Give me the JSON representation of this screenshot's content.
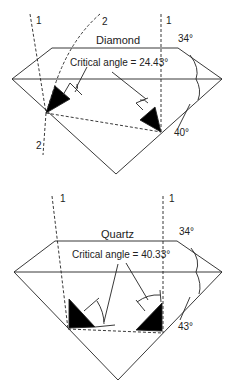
{
  "diagrams": [
    {
      "title": "Diamond",
      "critical_angle_label": "Critical angle = 24.43°",
      "crown_angle": "34°",
      "pavilion_angle": "40°",
      "rays": [
        "1",
        "2"
      ],
      "ray_labels": {
        "ray1_left": "1",
        "ray2_top": "2",
        "ray1_right": "1",
        "ray2_bottom": "2"
      }
    },
    {
      "title": "Quartz",
      "critical_angle_label": "Critical angle = 40.33°",
      "crown_angle": "34°",
      "pavilion_angle": "43°",
      "ray_labels": {
        "ray1_left": "1",
        "ray1_right": "1"
      }
    }
  ],
  "colors": {
    "line": "#222222",
    "fill": "#000000",
    "background": "#ffffff"
  }
}
